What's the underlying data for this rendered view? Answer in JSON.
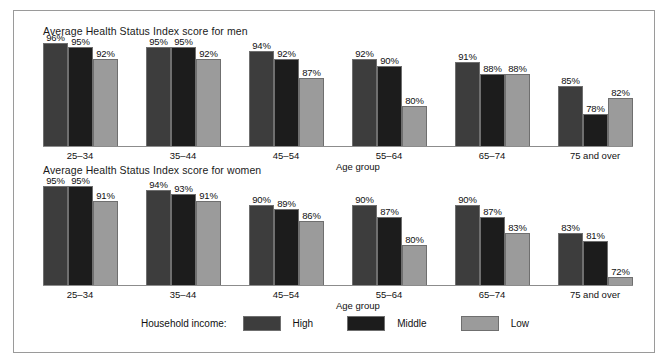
{
  "chart_data": {
    "type": "bar",
    "title": "",
    "xlabel": "Age group",
    "ylabel": "",
    "ylim": [
      70,
      100
    ],
    "grid": false,
    "legend_position": "bottom",
    "legend_title": "Household income:",
    "categories": [
      "25–34",
      "35–44",
      "45–54",
      "55–64",
      "65–74",
      "75 and over"
    ],
    "panels": [
      {
        "title": "Average Health Status Index score for men",
        "xlabel": "Age group",
        "series": [
          {
            "name": "High",
            "values": [
              96,
              95,
              94,
              92,
              91,
              85
            ],
            "labels": [
              "96%",
              "95%",
              "94%",
              "92%",
              "91%",
              "85%"
            ],
            "color": "#3d3d3d"
          },
          {
            "name": "Middle",
            "values": [
              95,
              95,
              92,
              90,
              88,
              78
            ],
            "labels": [
              "95%",
              "95%",
              "92%",
              "90%",
              "88%",
              "78%"
            ],
            "color": "#1c1c1c"
          },
          {
            "name": "Low",
            "values": [
              92,
              92,
              87,
              80,
              88,
              82
            ],
            "labels": [
              "92%",
              "92%",
              "87%",
              "80%",
              "88%",
              "82%"
            ],
            "color": "#9b9b9b"
          }
        ]
      },
      {
        "title": "Average Health Status Index score for women",
        "xlabel": "Age group",
        "series": [
          {
            "name": "High",
            "values": [
              95,
              94,
              90,
              90,
              90,
              83
            ],
            "labels": [
              "95%",
              "94%",
              "90%",
              "90%",
              "90%",
              "83%"
            ],
            "color": "#3d3d3d"
          },
          {
            "name": "Middle",
            "values": [
              95,
              93,
              89,
              87,
              87,
              81
            ],
            "labels": [
              "95%",
              "93%",
              "89%",
              "87%",
              "87%",
              "81%"
            ],
            "color": "#1c1c1c"
          },
          {
            "name": "Low",
            "values": [
              91,
              91,
              86,
              80,
              83,
              72
            ],
            "labels": [
              "91%",
              "91%",
              "86%",
              "80%",
              "83%",
              "72%"
            ],
            "color": "#9b9b9b"
          }
        ]
      }
    ],
    "legend": [
      {
        "name": "High",
        "color": "#3d3d3d"
      },
      {
        "name": "Middle",
        "color": "#1c1c1c"
      },
      {
        "name": "Low",
        "color": "#9b9b9b"
      }
    ]
  },
  "figure": {
    "border_color": "#9a9a9a",
    "background": "#ffffff"
  }
}
